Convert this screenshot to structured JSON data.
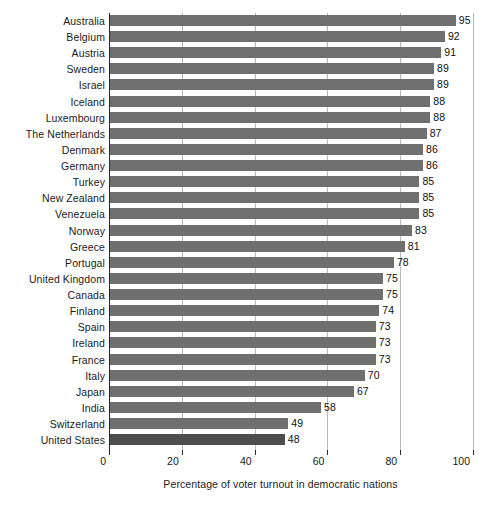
{
  "chart_data": {
    "type": "bar",
    "orientation": "horizontal",
    "title": "",
    "xlabel": "Percentage of voter turnout in democratic nations",
    "ylabel": "",
    "xlim": [
      0,
      100
    ],
    "xticks": [
      0,
      20,
      40,
      60,
      80,
      100
    ],
    "xtick_labels": [
      "0",
      "20",
      "40",
      "60",
      "80",
      "100"
    ],
    "grid": "vertical",
    "legend": "none",
    "bar_color": "#6f6f6f",
    "highlight_color": "#4e4e4e",
    "highlight_category": "United States",
    "categories": [
      "Australia",
      "Belgium",
      "Austria",
      "Sweden",
      "Israel",
      "Iceland",
      "Luxembourg",
      "The Netherlands",
      "Denmark",
      "Germany",
      "Turkey",
      "New Zealand",
      "Venezuela",
      "Norway",
      "Greece",
      "Portugal",
      "United Kingdom",
      "Canada",
      "Finland",
      "Spain",
      "Ireland",
      "France",
      "Italy",
      "Japan",
      "India",
      "Switzerland",
      "United States"
    ],
    "values": [
      95,
      92,
      91,
      89,
      89,
      88,
      88,
      87,
      86,
      86,
      85,
      85,
      85,
      83,
      81,
      78,
      75,
      75,
      74,
      73,
      73,
      73,
      70,
      67,
      58,
      49,
      48
    ],
    "value_labels": [
      "95",
      "92",
      "91",
      "89",
      "89",
      "88",
      "88",
      "87",
      "86",
      "86",
      "85",
      "85",
      "85",
      "83",
      "81",
      "78",
      "75",
      "75",
      "74",
      "73",
      "73",
      "73",
      "70",
      "67",
      "58",
      "49",
      "48"
    ]
  }
}
